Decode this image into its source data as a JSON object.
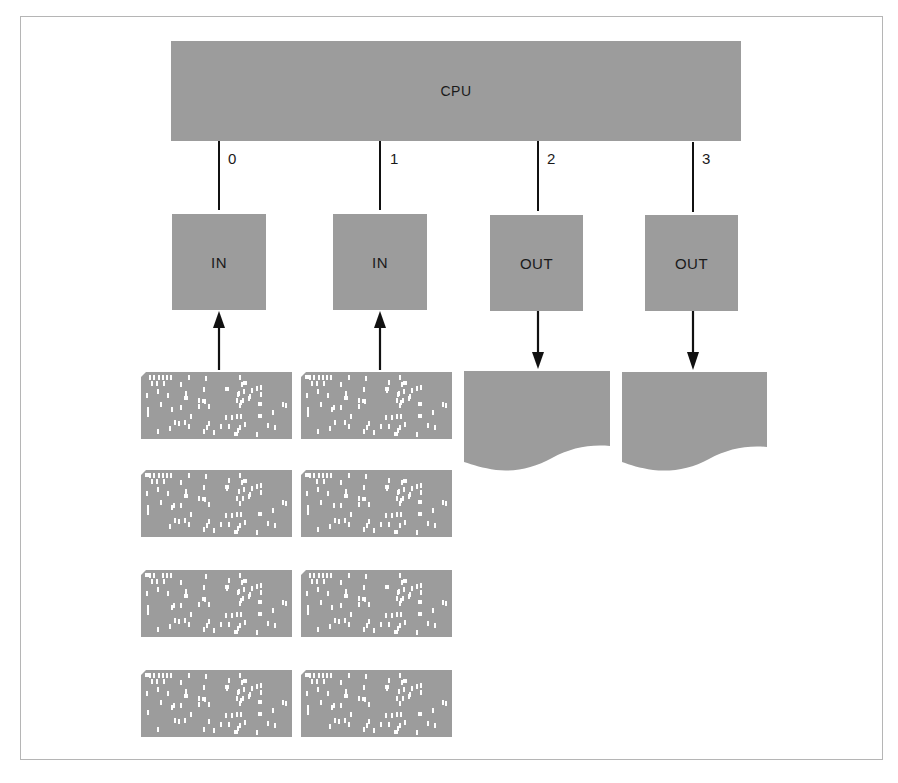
{
  "diagram": {
    "cpu": {
      "label": "CPU"
    },
    "ports": [
      {
        "number": "0",
        "device": "IN",
        "direction": "input",
        "medium": "punched-card-deck"
      },
      {
        "number": "1",
        "device": "IN",
        "direction": "input",
        "medium": "punched-card-deck"
      },
      {
        "number": "2",
        "device": "OUT",
        "direction": "output",
        "medium": "printed-document"
      },
      {
        "number": "3",
        "device": "OUT",
        "direction": "output",
        "medium": "printed-document"
      }
    ],
    "card_decks": {
      "columns": 2,
      "cards_per_column": 4
    },
    "colors": {
      "block_fill": "#9c9c9c",
      "line": "#111111",
      "hole": "#ffffff",
      "frame": "#b5b5b5"
    }
  }
}
